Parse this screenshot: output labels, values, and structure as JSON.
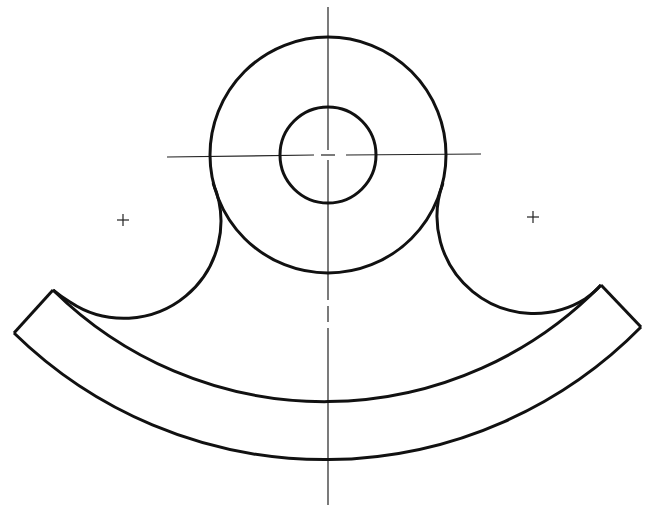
{
  "drawing": {
    "title": "",
    "type": "mechanical part outline with centerlines",
    "line_color": "#111111",
    "background": "#ffffff",
    "components": [
      "outer-boss-circle",
      "bore-circle",
      "left-fillet-arc",
      "right-fillet-arc",
      "arc-band-inner",
      "arc-band-outer",
      "left-band-end",
      "right-band-end",
      "vertical-centerline",
      "horizontal-centerline",
      "left-fillet-center-mark",
      "right-fillet-center-mark"
    ]
  }
}
